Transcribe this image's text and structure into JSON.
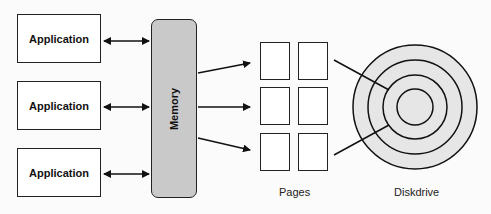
{
  "applications": [
    {
      "label": "Application"
    },
    {
      "label": "Application"
    },
    {
      "label": "Application"
    }
  ],
  "memory": {
    "label": "Memory",
    "fill": "#c9c9c9"
  },
  "pages": {
    "label": "Pages",
    "rows": 3,
    "cols": 2
  },
  "diskdrive": {
    "label": "Diskdrive",
    "fill": "#e6e6e6",
    "rings": 4
  }
}
